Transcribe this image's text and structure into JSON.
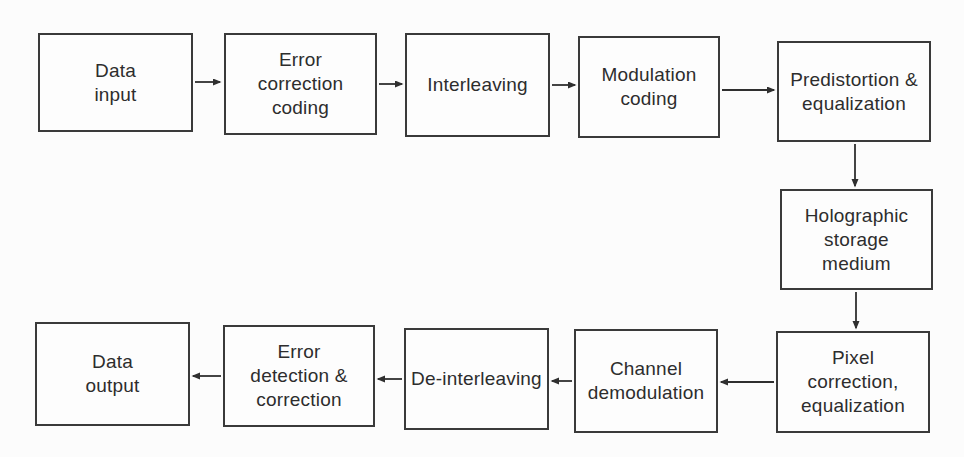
{
  "diagram_type": "flowchart",
  "colors": {
    "page_bg": "#fcfcfc",
    "box_bg": "#fdfdfd",
    "border_color": "#3a3a3a",
    "text_color": "#2d2d2d",
    "arrow_color": "#2f2f2f"
  },
  "nodes": {
    "data_input": {
      "label": "Data\ninput"
    },
    "error_correction_coding": {
      "label": "Error\ncorrection\ncoding"
    },
    "interleaving": {
      "label": "Interleaving"
    },
    "modulation_coding": {
      "label": "Modulation\ncoding"
    },
    "predistortion_equalization": {
      "label": "Predistortion &\nequalization"
    },
    "holographic_storage_medium": {
      "label": "Holographic\nstorage\nmedium"
    },
    "pixel_correction_equalization": {
      "label": "Pixel\ncorrection,\nequalization"
    },
    "channel_demodulation": {
      "label": "Channel\ndemodulation"
    },
    "de_interleaving": {
      "label": "De-interleaving"
    },
    "error_detection_correction": {
      "label": "Error\ndetection &\ncorrection"
    },
    "data_output": {
      "label": "Data\noutput"
    }
  },
  "edges": [
    {
      "from": "data_input",
      "to": "error_correction_coding"
    },
    {
      "from": "error_correction_coding",
      "to": "interleaving"
    },
    {
      "from": "interleaving",
      "to": "modulation_coding"
    },
    {
      "from": "modulation_coding",
      "to": "predistortion_equalization"
    },
    {
      "from": "predistortion_equalization",
      "to": "holographic_storage_medium"
    },
    {
      "from": "holographic_storage_medium",
      "to": "pixel_correction_equalization"
    },
    {
      "from": "pixel_correction_equalization",
      "to": "channel_demodulation"
    },
    {
      "from": "channel_demodulation",
      "to": "de_interleaving"
    },
    {
      "from": "de_interleaving",
      "to": "error_detection_correction"
    },
    {
      "from": "error_detection_correction",
      "to": "data_output"
    }
  ]
}
